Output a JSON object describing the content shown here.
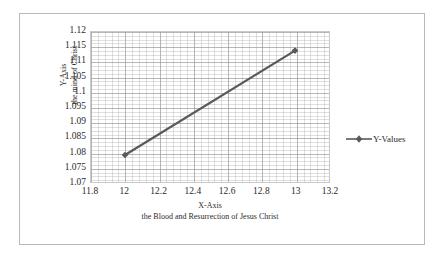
{
  "chart_data": {
    "type": "line",
    "title": "",
    "series": [
      {
        "name": "Y-Values",
        "x": [
          12,
          13
        ],
        "values": [
          1.079,
          1.1138
        ]
      }
    ],
    "xlabel": "X-Axis",
    "xlabel_sub": "the Blood and Resurrection of Jesus Christ",
    "ylabel": "Y-Axis",
    "ylabel_sub": "the mind of Christ",
    "xlim": [
      11.8,
      13.2
    ],
    "ylim": [
      1.07,
      1.12
    ],
    "xticks": [
      "11.8",
      "12",
      "12.2",
      "12.4",
      "12.6",
      "12.8",
      "13",
      "13.2"
    ],
    "xtick_values": [
      11.8,
      12,
      12.2,
      12.4,
      12.6,
      12.8,
      13,
      13.2
    ],
    "yticks": [
      "1.07",
      "1.075",
      "1.08",
      "1.085",
      "1.09",
      "1.095",
      "1.1",
      "1.105",
      "1.11",
      "1.115",
      "1.12"
    ],
    "ytick_values": [
      1.07,
      1.075,
      1.08,
      1.085,
      1.09,
      1.095,
      1.1,
      1.105,
      1.11,
      1.115,
      1.12
    ],
    "grid": true,
    "minor_grid": true,
    "legend": [
      "Y-Values"
    ],
    "legend_position": "right",
    "series_color": "#595959",
    "marker": "diamond"
  },
  "legend": {
    "entry_label": "Y-Values"
  },
  "axes": {
    "y_title_line1": "Y-Axis",
    "y_title_line2": "the mind of Christ",
    "x_title_line1": "X-Axis",
    "x_title_line2": "the Blood and Resurrection of Jesus Christ"
  },
  "colors": {
    "series": "#595959",
    "frame": "#b9b9b9",
    "grid_major": "#969696",
    "grid_minor": "#afafaf",
    "text": "#2b2b2b"
  }
}
